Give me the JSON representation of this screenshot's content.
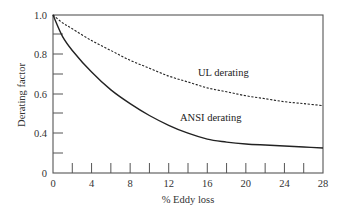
{
  "chart_data": {
    "type": "line",
    "title": "",
    "xlabel": "% Eddy loss",
    "ylabel": "Derating factor",
    "xlim": [
      0,
      28
    ],
    "ylim": [
      0,
      1.0
    ],
    "grid": false,
    "legend": "inline labels",
    "x_ticks": [
      "0",
      "4",
      "8",
      "12",
      "16",
      "20",
      "24",
      "28"
    ],
    "y_ticks": [
      "0",
      "0.4",
      "0.6",
      "0.8",
      "1.0"
    ],
    "x": [
      0,
      1,
      2,
      4,
      6,
      8,
      10,
      12,
      14,
      16,
      18,
      20,
      22,
      24,
      26,
      28
    ],
    "series": [
      {
        "name": "UL derating",
        "style": "dashed",
        "values": [
          1.0,
          0.96,
          0.93,
          0.87,
          0.82,
          0.77,
          0.73,
          0.69,
          0.66,
          0.63,
          0.61,
          0.59,
          0.575,
          0.56,
          0.55,
          0.54
        ]
      },
      {
        "name": "ANSI derating",
        "style": "solid",
        "values": [
          1.0,
          0.89,
          0.82,
          0.71,
          0.62,
          0.55,
          0.49,
          0.44,
          0.4,
          0.37,
          0.355,
          0.345,
          0.34,
          0.335,
          0.33,
          0.325
        ]
      }
    ]
  },
  "labels": {
    "ul": "UL derating",
    "ansi": "ANSI derating",
    "xlabel": "% Eddy loss",
    "ylabel": "Derating factor"
  },
  "colors": {
    "axis": "#555555",
    "curve": "#222222"
  }
}
